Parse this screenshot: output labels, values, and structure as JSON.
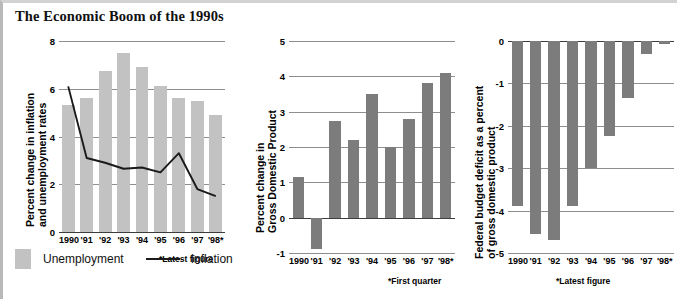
{
  "title": "The Economic Boom of the 1990s",
  "colors": {
    "unemployment_bar": "#c2c2c2",
    "dark_bar": "#7c7c7c",
    "inflation_line": "#1a1a1a",
    "gridline": "#8e8e8e",
    "axis": "#3d3d3d"
  },
  "legend": {
    "swatch_label": "Unemployment",
    "line_label": "Inflation"
  },
  "charts": [
    {
      "id": "inflation-unemployment",
      "ylabel_line1": "Percent change in inflation",
      "ylabel_line2": "and unemployment rates",
      "footnote": "*Latest figure"
    },
    {
      "id": "gross-domestic-product",
      "ylabel_line1": "Percent change in",
      "ylabel_line2": "Gross Domestic Product",
      "footnote": "*First quarter"
    },
    {
      "id": "federal-budget-deficit",
      "ylabel_line1": "Federal budget deficit as a percent",
      "ylabel_line2": "of gross domestic product",
      "footnote": "*Latest figure"
    }
  ],
  "chart_data": [
    {
      "type": "bar",
      "id": "inflation-unemployment",
      "title": "",
      "xlabel": "",
      "ylabel": "Percent change in inflation and unemployment rates",
      "categories": [
        "1990",
        "'91",
        "'92",
        "'93",
        "'94",
        "'95",
        "'96",
        "'97",
        "'98*"
      ],
      "ylim": [
        0,
        8
      ],
      "yticks": [
        0,
        2,
        4,
        6,
        8
      ],
      "yticklabels": [
        "0",
        "2",
        "4",
        "6",
        "8"
      ],
      "grid": true,
      "legend": [
        "Unemployment",
        "Inflation"
      ],
      "series": [
        {
          "name": "Unemployment",
          "kind": "bar",
          "color": "#c2c2c2",
          "values": [
            5.3,
            5.6,
            6.75,
            7.5,
            6.9,
            6.1,
            5.6,
            5.5,
            4.9
          ]
        },
        {
          "name": "Inflation",
          "kind": "line",
          "color": "#1a1a1a",
          "values": [
            6.1,
            3.1,
            2.9,
            2.65,
            2.7,
            2.5,
            3.3,
            1.8,
            1.5
          ]
        }
      ],
      "annotations": [
        "*Latest figure"
      ]
    },
    {
      "type": "bar",
      "id": "gross-domestic-product",
      "title": "",
      "xlabel": "",
      "ylabel": "Percent change in Gross Domestic Product",
      "categories": [
        "1990",
        "'91",
        "'92",
        "'93",
        "'94",
        "'95",
        "'96",
        "'97",
        "'98*"
      ],
      "ylim": [
        -1,
        5
      ],
      "yticks": [
        -1,
        0,
        1,
        2,
        3,
        4,
        5
      ],
      "yticklabels": [
        "-1",
        "0",
        "1",
        "2",
        "3",
        "4",
        "5"
      ],
      "grid": true,
      "values": [
        1.15,
        -0.9,
        2.75,
        2.2,
        3.5,
        2.0,
        2.8,
        3.8,
        4.1
      ],
      "bar_color": "#7c7c7c",
      "annotations": [
        "*First quarter"
      ]
    },
    {
      "type": "bar",
      "id": "federal-budget-deficit",
      "title": "",
      "xlabel": "",
      "ylabel": "Federal budget deficit as a percent of gross domestic product",
      "categories": [
        "1990",
        "'91",
        "'92",
        "'93",
        "'94",
        "'95",
        "'96",
        "'97",
        "'98*"
      ],
      "ylim": [
        -5,
        0
      ],
      "yticks": [
        -5,
        -4,
        -3,
        -2,
        -1,
        0
      ],
      "yticklabels": [
        "-5",
        "-4",
        "-3",
        "-2",
        "-1",
        "0"
      ],
      "grid": true,
      "values": [
        -3.9,
        -4.55,
        -4.7,
        -3.9,
        -3.0,
        -2.25,
        -1.35,
        -0.3,
        -0.06
      ],
      "bar_color": "#7c7c7c",
      "annotations": [
        "*Latest figure"
      ]
    }
  ]
}
